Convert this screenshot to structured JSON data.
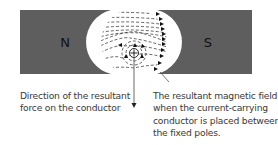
{
  "colors": {
    "magnet_fill": "#5e5e5e",
    "field_line": "#222222",
    "background": "#ffffff",
    "text": "#3a3a3a"
  },
  "magnets": {
    "north_label": "N",
    "south_label": "S"
  },
  "conductor": {
    "symbol": "⊕",
    "meaning": "current into the page"
  },
  "captions": {
    "force": {
      "lines": [
        "Direction of the resultant",
        "force on the conductor"
      ]
    },
    "field": {
      "lines": [
        "The resultant magnetic field",
        "when the current-carrying",
        "conductor is placed between",
        "the fixed poles."
      ]
    }
  }
}
